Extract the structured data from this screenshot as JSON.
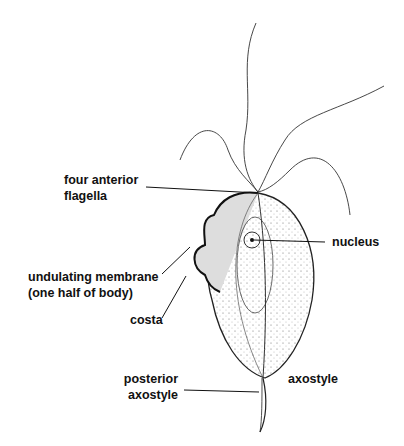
{
  "diagram": {
    "labels": {
      "four_anterior_flagella_1": "four anterior",
      "four_anterior_flagella_2": "flagella",
      "nucleus": "nucleus",
      "undulating_membrane_1": "undulating membrane",
      "undulating_membrane_2": "(one half of body)",
      "costa": "costa",
      "posterior_axostyle_1": "posterior",
      "posterior_axostyle_2": "axostyle",
      "axostyle": "axostyle"
    },
    "colors": {
      "ink": "#111111",
      "background": "#ffffff"
    }
  }
}
